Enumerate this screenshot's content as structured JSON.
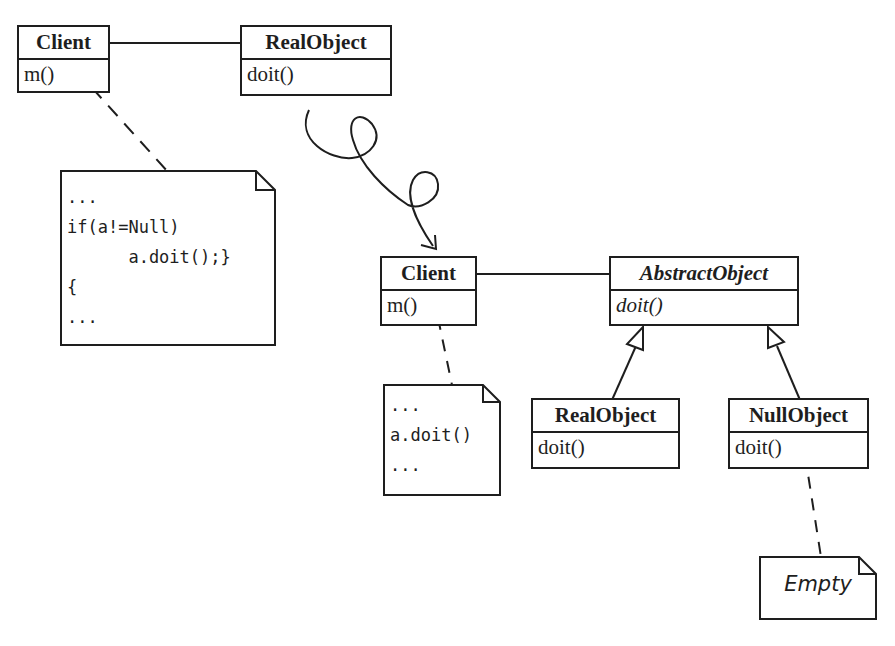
{
  "diagram": {
    "type": "uml-class-diagram",
    "topic": "Null Object refactoring",
    "before": {
      "classes": [
        {
          "id": "client-before",
          "name": "Client",
          "operations": [
            "m()"
          ]
        },
        {
          "id": "realobject-before",
          "name": "RealObject",
          "operations": [
            "doit()"
          ]
        }
      ],
      "associations": [
        {
          "from": "Client",
          "to": "RealObject"
        }
      ],
      "note": {
        "attached_to": "Client.m()",
        "lines": [
          "...",
          "if(a!=Null)",
          "      a.doit();}",
          "{",
          "..."
        ]
      }
    },
    "transition_arrow": "curly-arrow",
    "after": {
      "classes": [
        {
          "id": "client-after",
          "name": "Client",
          "operations": [
            "m()"
          ]
        },
        {
          "id": "abstractobject",
          "name": "AbstractObject",
          "operations": [
            "doit()"
          ],
          "abstract": true
        },
        {
          "id": "realobject-after",
          "name": "RealObject",
          "operations": [
            "doit()"
          ]
        },
        {
          "id": "nullobject",
          "name": "NullObject",
          "operations": [
            "doit()"
          ]
        }
      ],
      "associations": [
        {
          "from": "Client",
          "to": "AbstractObject"
        }
      ],
      "generalizations": [
        {
          "child": "RealObject",
          "parent": "AbstractObject"
        },
        {
          "child": "NullObject",
          "parent": "AbstractObject"
        }
      ],
      "notes": [
        {
          "attached_to": "Client.m()",
          "lines": [
            "...",
            "a.doit()",
            "..."
          ]
        },
        {
          "attached_to": "NullObject.doit()",
          "text": "Empty"
        }
      ]
    }
  },
  "labels": {
    "client_before_name": "Client",
    "client_before_op": "m()",
    "real_before_name": "RealObject",
    "real_before_op": "doit()",
    "note_before_text": "...\nif(a!=Null)\n      a.doit();}\n{\n...",
    "client_after_name": "Client",
    "client_after_op": "m()",
    "abstract_name": "AbstractObject",
    "abstract_op": "doit()",
    "real_after_name": "RealObject",
    "real_after_op": "doit()",
    "null_name": "NullObject",
    "null_op": "doit()",
    "note_after_text": "...\na.doit()\n...",
    "note_empty_text": "Empty"
  },
  "colors": {
    "stroke": "#1e1e1e",
    "background": "#ffffff"
  }
}
